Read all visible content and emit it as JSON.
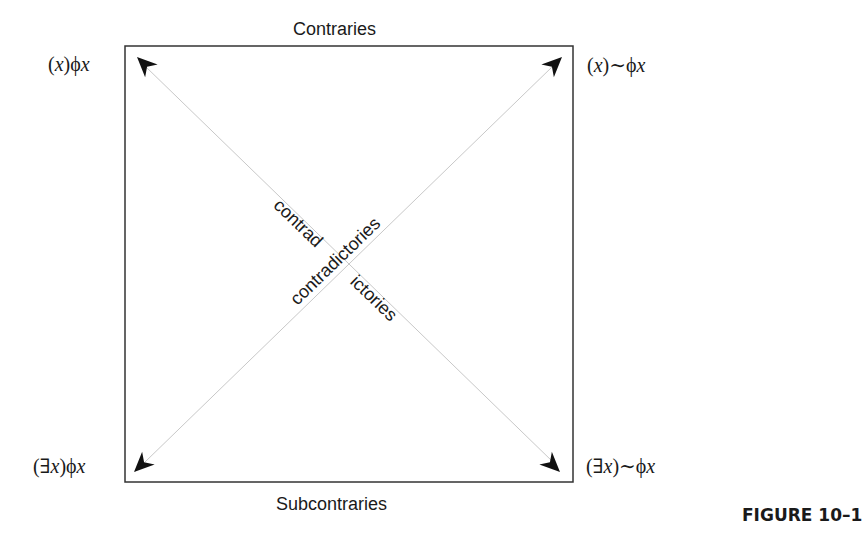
{
  "figure": {
    "caption": "FIGURE 10–1",
    "top_label": "Contraries",
    "bottom_label": "Subcontraries",
    "diagonal_labels": {
      "descending_left_part": "contrad",
      "descending_right_part": "ictories",
      "ascending": "contradictories"
    },
    "corners": {
      "top_left": {
        "prefix": "(",
        "var": "x",
        "mid": ")ϕ",
        "suffix_var": "x",
        "text": "(x)ϕx"
      },
      "top_right": {
        "prefix": "(",
        "var": "x",
        "mid": ")∼ϕ",
        "suffix_var": "x",
        "text": "(x)∼ϕx"
      },
      "bottom_left": {
        "prefix": "(∃",
        "var": "x",
        "mid": ")ϕ",
        "suffix_var": "x",
        "text": "(∃x)ϕx"
      },
      "bottom_right": {
        "prefix": "(∃",
        "var": "x",
        "mid": ")∼ϕ",
        "suffix_var": "x",
        "text": "(∃x)∼ϕx"
      }
    },
    "colors": {
      "box_stroke": "#333333",
      "diagonal_stroke": "#c8c8c8",
      "arrowhead": "#111111",
      "text": "#1a1a1a"
    }
  }
}
